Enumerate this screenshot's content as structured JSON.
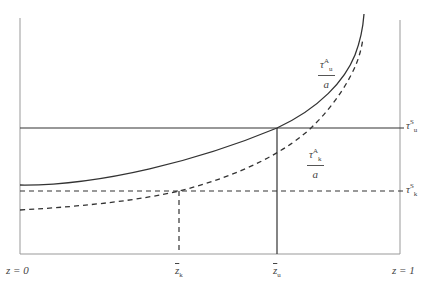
{
  "diagram": {
    "type": "economic-threshold-diagram",
    "axes": {
      "left_label": "z = 0",
      "right_label": "z = 1"
    },
    "x_markers": [
      {
        "symbol": "z",
        "subscript": "k",
        "overbar": true,
        "x_px": 179,
        "line_style": "dashed"
      },
      {
        "symbol": "z",
        "subscript": "u",
        "overbar": true,
        "x_px": 277,
        "line_style": "solid"
      }
    ],
    "horizontal_lines": [
      {
        "symbol": "τ",
        "superscript": "S",
        "subscript": "u",
        "y_px": 128,
        "style": "solid"
      },
      {
        "symbol": "τ",
        "superscript": "S",
        "subscript": "k",
        "y_px": 191,
        "style": "dashed"
      }
    ],
    "curves": [
      {
        "label_num": "τ",
        "label_sup": "A",
        "label_sub": "u",
        "label_den": "a",
        "style": "solid"
      },
      {
        "label_num": "τ",
        "label_sup": "A",
        "label_sub": "k",
        "label_den": "a",
        "style": "dashed"
      }
    ],
    "colors": {
      "line": "#333333",
      "axis": "#888888"
    }
  }
}
